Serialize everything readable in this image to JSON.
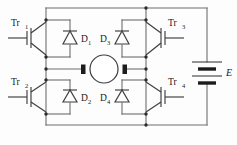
{
  "diagram": {
    "type": "circuit-schematic",
    "colors": {
      "wire": "#6e6e6e",
      "device": "#3d3d3d",
      "node": "#2b2b2b",
      "background": "#fdfdfd",
      "text": "#1a1a1a"
    }
  },
  "labels": {
    "tr1": {
      "base": "Tr",
      "sub": "1"
    },
    "tr2": {
      "base": "Tr",
      "sub": "2"
    },
    "tr3": {
      "base": "Tr",
      "sub": "3"
    },
    "tr4": {
      "base": "Tr",
      "sub": "4"
    },
    "d1": {
      "base": "D",
      "sub": "1"
    },
    "d2": {
      "base": "D",
      "sub": "2"
    },
    "d3": {
      "base": "D",
      "sub": "3"
    },
    "d4": {
      "base": "D",
      "sub": "4"
    },
    "supply": "E"
  },
  "components": {
    "transistors": [
      {
        "id": "tr1",
        "kind": "igbt",
        "position": "top-left",
        "gate_lead": "left"
      },
      {
        "id": "tr2",
        "kind": "igbt",
        "position": "bottom-left",
        "gate_lead": "left"
      },
      {
        "id": "tr3",
        "kind": "igbt",
        "position": "top-right",
        "gate_lead": "right"
      },
      {
        "id": "tr4",
        "kind": "igbt",
        "position": "bottom-right",
        "gate_lead": "right"
      }
    ],
    "diodes": [
      {
        "id": "d1",
        "kind": "freewheel-diode",
        "position": "top-left",
        "cathode": "up"
      },
      {
        "id": "d2",
        "kind": "freewheel-diode",
        "position": "bottom-left",
        "cathode": "up"
      },
      {
        "id": "d3",
        "kind": "freewheel-diode",
        "position": "top-right",
        "cathode": "up"
      },
      {
        "id": "d4",
        "kind": "freewheel-diode",
        "position": "bottom-right",
        "cathode": "up"
      }
    ],
    "motor": {
      "id": "motor",
      "kind": "dc-motor",
      "brushes": 2
    },
    "source": {
      "id": "supply",
      "kind": "battery",
      "cells": 2,
      "label": "E"
    }
  }
}
